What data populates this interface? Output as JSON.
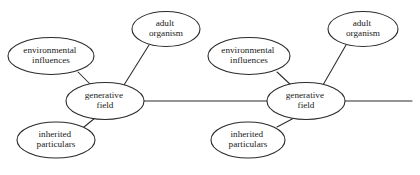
{
  "diagram": {
    "background_color": "#ffffff",
    "stroke_color": "#2b2b2b",
    "text_color": "#1a1a1a",
    "clusters": [
      {
        "id": "cluster-left",
        "center": {
          "label_line1": "generative",
          "label_line2": "field",
          "cx": 105,
          "cy": 101,
          "rx": 39,
          "ry": 18.5
        },
        "satellites": [
          {
            "id": "environmental-influences-left",
            "label_line1": "environmental",
            "label_line2": "influences",
            "cx": 51,
            "cy": 56,
            "rx": 43,
            "ry": 18.5
          },
          {
            "id": "adult-organism-left",
            "label_line1": "adult",
            "label_line2": "organism",
            "cx": 166,
            "cy": 29,
            "rx": 34,
            "ry": 17.5
          },
          {
            "id": "inherited-particulars-left",
            "label_line1": "inherited",
            "label_line2": "particulars",
            "cx": 56,
            "cy": 140,
            "rx": 39,
            "ry": 18
          }
        ]
      },
      {
        "id": "cluster-right",
        "center": {
          "label_line1": "generative",
          "label_line2": "field",
          "cx": 306,
          "cy": 101,
          "rx": 39,
          "ry": 18.5
        },
        "satellites": [
          {
            "id": "environmental-influences-right",
            "label_line1": "environmental",
            "label_line2": "influences",
            "cx": 249,
            "cy": 56,
            "rx": 41,
            "ry": 18.5
          },
          {
            "id": "adult-organism-right",
            "label_line1": "adult",
            "label_line2": "organism",
            "cx": 363,
            "cy": 29,
            "rx": 35,
            "ry": 17.5
          },
          {
            "id": "inherited-particulars-right",
            "label_line1": "inherited",
            "label_line2": "particulars",
            "cx": 248,
            "cy": 140,
            "rx": 37,
            "ry": 18
          }
        ]
      }
    ],
    "connectors": [
      {
        "id": "edge-env-to-field-left",
        "x1": 78,
        "y1": 72,
        "x2": 92,
        "y2": 86
      },
      {
        "id": "edge-adult-to-field-left",
        "x1": 149,
        "y1": 45,
        "x2": 124,
        "y2": 85
      },
      {
        "id": "edge-inherited-to-field-left",
        "x1": 84,
        "y1": 127,
        "x2": 95,
        "y2": 118
      },
      {
        "id": "edge-field-to-field-horizontal",
        "x1": 144,
        "y1": 101,
        "x2": 267,
        "y2": 101
      },
      {
        "id": "edge-env-to-field-right",
        "x1": 277,
        "y1": 72,
        "x2": 292,
        "y2": 86
      },
      {
        "id": "edge-adult-to-field-right",
        "x1": 346,
        "y1": 45,
        "x2": 323,
        "y2": 85
      },
      {
        "id": "edge-inherited-to-field-right",
        "x1": 277,
        "y1": 127,
        "x2": 294,
        "y2": 118
      },
      {
        "id": "edge-field-right-tail",
        "x1": 345,
        "y1": 101,
        "x2": 412,
        "y2": 101
      }
    ]
  }
}
